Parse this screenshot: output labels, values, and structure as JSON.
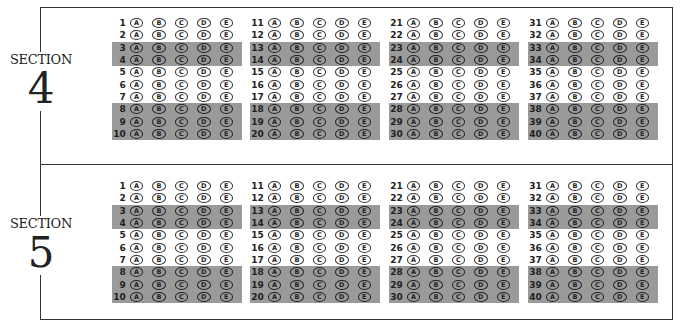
{
  "sections": [
    {
      "label": "SECTION",
      "number": "4",
      "top": 17,
      "blocks": [
        {
          "questions": [
            "1",
            "2",
            "3",
            "4",
            "5",
            "6",
            "7",
            "8",
            "9",
            "10"
          ]
        },
        {
          "questions": [
            "11",
            "12",
            "13",
            "14",
            "15",
            "16",
            "17",
            "18",
            "19",
            "20"
          ]
        },
        {
          "questions": [
            "21",
            "22",
            "23",
            "24",
            "25",
            "26",
            "27",
            "28",
            "29",
            "30"
          ]
        },
        {
          "questions": [
            "31",
            "32",
            "33",
            "34",
            "35",
            "36",
            "37",
            "38",
            "39",
            "40"
          ]
        }
      ]
    },
    {
      "label": "SECTION",
      "number": "5",
      "top": 180,
      "blocks": [
        {
          "questions": [
            "1",
            "2",
            "3",
            "4",
            "5",
            "6",
            "7",
            "8",
            "9",
            "10"
          ]
        },
        {
          "questions": [
            "11",
            "12",
            "13",
            "14",
            "15",
            "16",
            "17",
            "18",
            "19",
            "20"
          ]
        },
        {
          "questions": [
            "21",
            "22",
            "23",
            "24",
            "25",
            "26",
            "27",
            "28",
            "29",
            "30"
          ]
        },
        {
          "questions": [
            "31",
            "32",
            "33",
            "34",
            "35",
            "36",
            "37",
            "38",
            "39",
            "40"
          ]
        }
      ]
    }
  ],
  "choices": [
    "A",
    "B",
    "C",
    "D",
    "E"
  ],
  "shaded_rows": [
    2,
    3,
    7,
    8,
    9
  ],
  "block_x": [
    112,
    250,
    389,
    528
  ],
  "colors": {
    "shade": "#9a9a9a",
    "border": "#333333"
  }
}
